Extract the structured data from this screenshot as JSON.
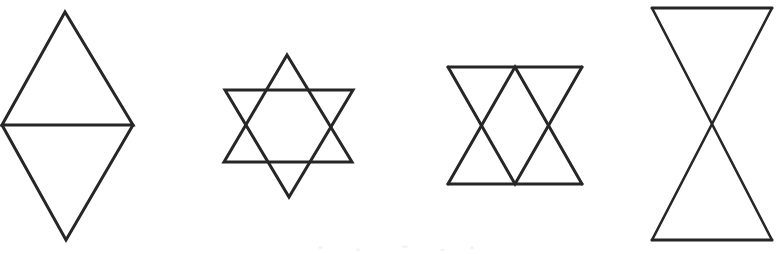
{
  "sheet": {
    "title": "Geometric Figures Worksheet",
    "width": 778,
    "height": 254,
    "background_color": "#ffffff",
    "stroke_color": "#262626",
    "stroke_width": 3,
    "description": "Four line-drawn geometric figures composed of triangles, arranged left to right on a white scanned page."
  },
  "figures": [
    {
      "id": "figure-1",
      "name": "rhombus-two-triangles",
      "label": "Rhombus formed by two triangles sharing a horizontal edge",
      "triangle_count": 2,
      "vertices": {
        "top": [
          65,
          12
        ],
        "left": [
          2,
          125
        ],
        "right": [
          133,
          125
        ],
        "bottom": [
          66,
          240
        ]
      },
      "paths": [
        "M 65 12 L 2 125 L 133 125 Z",
        "M 2 125 L 66 240 L 133 125"
      ]
    },
    {
      "id": "figure-2",
      "name": "hexagram-star-of-david",
      "label": "Six-pointed star formed by two overlapping equilateral triangles",
      "triangle_count": 2,
      "vertices": {
        "up_apex": [
          287,
          55
        ],
        "up_left": [
          224,
          162
        ],
        "up_right": [
          352,
          162
        ],
        "down_apex": [
          289,
          197
        ],
        "down_left": [
          225,
          90
        ],
        "down_right": [
          353,
          90
        ]
      },
      "paths": [
        "M 287 55 L 224 162 L 352 162 Z",
        "M 225 90 L 353 90 L 289 197 Z"
      ]
    },
    {
      "id": "figure-3",
      "name": "zigzag-triangle-band",
      "label": "Band of four alternating triangles between two horizontal lines",
      "triangle_count": 4,
      "bounds": {
        "left": 448,
        "right": 582,
        "top": 67,
        "bottom": 184,
        "mid_x": 515
      },
      "paths": [
        "M 448 67 L 582 67",
        "M 448 184 L 582 184",
        "M 448 67 L 515 184 L 582 67",
        "M 448 184 L 515 67 L 582 184"
      ]
    },
    {
      "id": "figure-4",
      "name": "bowtie-hourglass",
      "label": "Hourglass bowtie formed by two triangles meeting at a central crossing point",
      "triangle_count": 2,
      "vertices": {
        "top_left": [
          652,
          8
        ],
        "top_right": [
          772,
          8
        ],
        "bottom_left": [
          652,
          240
        ],
        "bottom_right": [
          772,
          240
        ],
        "crossing": [
          713,
          124
        ]
      },
      "paths": [
        "M 652 8 L 772 8",
        "M 652 240 L 772 240",
        "M 652 8 L 772 240",
        "M 772 8 L 652 240"
      ]
    }
  ],
  "artifacts": {
    "description": "Faint grey scanner speckles near the lower centre of the page",
    "specks": [
      {
        "x": 318,
        "y": 246,
        "w": 5,
        "h": 3
      },
      {
        "x": 356,
        "y": 248,
        "w": 4,
        "h": 3
      },
      {
        "x": 402,
        "y": 245,
        "w": 6,
        "h": 3
      },
      {
        "x": 440,
        "y": 249,
        "w": 5,
        "h": 2
      },
      {
        "x": 470,
        "y": 246,
        "w": 4,
        "h": 3
      }
    ]
  }
}
